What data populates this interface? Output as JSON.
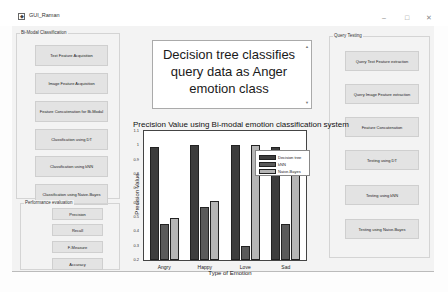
{
  "window": {
    "title": "GUI_Raman",
    "controls": {
      "minimize": "–",
      "maximize": "□",
      "close": "✕"
    }
  },
  "bimodal_panel": {
    "label": "Bi-Modal Classification",
    "buttons": [
      "Text Feature Acquisition",
      "Image Feature Acquisition",
      "Feature Concatenation for Bi-Modal",
      "Classification using DT",
      "Classification using kNN",
      "Classification using Naive-Bayes"
    ]
  },
  "performance_panel": {
    "label": "Performance evaluation",
    "buttons": [
      "Precision",
      "Recall",
      "F-Measure",
      "Accuracy"
    ]
  },
  "query_panel": {
    "label": "Query Testing",
    "buttons": [
      "Query Text Feature extraction",
      "Query Image Feature extraction",
      "Feature Concatenation",
      "Testing using DT",
      "Testing using kNN",
      "Testing using Naive-Bayes"
    ]
  },
  "result": {
    "text": "Decision tree classifies query data as Anger emotion class"
  },
  "colors": {
    "decision_tree": "#3d3d3d",
    "knn": "#5a5a5a",
    "naive_bayes": "#b5b5b5"
  },
  "chart_data": {
    "type": "bar",
    "title": "Precision Value using Bi-modal emotion classification system",
    "xlabel": "Type of Emotion",
    "ylabel": "Precision Value",
    "ylim": [
      0.2,
      1.1
    ],
    "yticks": [
      "0.2",
      "0.3",
      "0.4",
      "0.5",
      "0.6",
      "0.7",
      "0.8",
      "0.9",
      "1",
      "1.1"
    ],
    "categories": [
      "Angry",
      "Happy",
      "Love",
      "Sad"
    ],
    "series": [
      {
        "name": "Decision tree",
        "values": [
          0.99,
          1.0,
          1.0,
          0.99
        ]
      },
      {
        "name": "kNN",
        "values": [
          0.45,
          0.57,
          0.3,
          0.45
        ]
      },
      {
        "name": "Naive-Bayes",
        "values": [
          0.49,
          0.61,
          1.0,
          0.97
        ]
      }
    ],
    "legend_position": "upper right",
    "grid": false
  }
}
